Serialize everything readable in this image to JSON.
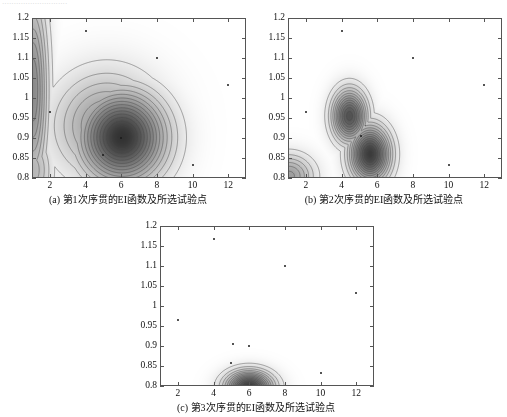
{
  "page": {
    "top_cut_text": "····························",
    "background": "#ffffff",
    "ink": "#1a1a1a"
  },
  "chart_data": [
    {
      "id": "panel-a",
      "type": "heatmap",
      "title": "",
      "caption": "(a) 第1次序贯的EI函数及所选试验点",
      "xlabel": "",
      "ylabel": "",
      "xlim": [
        1,
        13
      ],
      "ylim": [
        0.8,
        1.2
      ],
      "xticks": [
        2,
        4,
        6,
        8,
        10,
        12
      ],
      "yticks": [
        0.8,
        0.85,
        0.9,
        0.95,
        1,
        1.05,
        1.1,
        1.15,
        1.2
      ],
      "xtick_labels": [
        "2",
        "4",
        "6",
        "8",
        "10",
        "12"
      ],
      "ytick_labels": [
        "0.8",
        "0.85",
        "0.9",
        "0.95",
        "1",
        "1.05",
        "1.1",
        "1.15",
        "1.2"
      ],
      "grid": false,
      "legend": "none",
      "colormap": "grayscale-inverted",
      "peaks": [
        {
          "x": 6.05,
          "y": 0.902,
          "amp": 1.0,
          "sx": 1.55,
          "sy": 0.072,
          "rot": 0.25
        },
        {
          "x": 5.2,
          "y": 0.93,
          "amp": 0.44,
          "sx": 1.9,
          "sy": 0.085,
          "rot": 0.35
        },
        {
          "x": 1.05,
          "y": 1.02,
          "amp": 0.52,
          "sx": 0.55,
          "sy": 0.16,
          "rot": 0.0
        },
        {
          "x": 1.05,
          "y": 0.82,
          "amp": 0.3,
          "sx": 0.7,
          "sy": 0.06,
          "rot": 0.0
        }
      ],
      "points": [
        {
          "x": 4.0,
          "y": 1.167
        },
        {
          "x": 8.0,
          "y": 1.1
        },
        {
          "x": 12.0,
          "y": 1.032
        },
        {
          "x": 2.0,
          "y": 0.965
        },
        {
          "x": 5.0,
          "y": 0.857
        },
        {
          "x": 10.0,
          "y": 0.833
        },
        {
          "x": 6.0,
          "y": 0.9
        }
      ]
    },
    {
      "id": "panel-b",
      "type": "heatmap",
      "title": "",
      "caption": "(b) 第2次序贯的EI函数及所选试验点",
      "xlabel": "",
      "ylabel": "",
      "xlim": [
        1,
        13
      ],
      "ylim": [
        0.8,
        1.2
      ],
      "xticks": [
        2,
        4,
        6,
        8,
        10,
        12
      ],
      "yticks": [
        0.8,
        0.85,
        0.9,
        0.95,
        1,
        1.05,
        1.1,
        1.15,
        1.2
      ],
      "xtick_labels": [
        "2",
        "4",
        "6",
        "8",
        "10",
        "12"
      ],
      "ytick_labels": [
        "0.8",
        "0.85",
        "0.9",
        "0.95",
        "1",
        "1.05",
        "1.1",
        "1.15",
        "1.2"
      ],
      "grid": false,
      "legend": "none",
      "colormap": "grayscale-inverted",
      "peaks": [
        {
          "x": 4.45,
          "y": 0.955,
          "amp": 0.82,
          "sx": 0.62,
          "sy": 0.042,
          "rot": 0.0
        },
        {
          "x": 5.6,
          "y": 0.86,
          "amp": 0.95,
          "sx": 0.72,
          "sy": 0.045,
          "rot": -0.2
        },
        {
          "x": 4.9,
          "y": 0.905,
          "amp": 0.3,
          "sx": 0.55,
          "sy": 0.035,
          "rot": 0.0
        },
        {
          "x": 1.05,
          "y": 0.805,
          "amp": 0.42,
          "sx": 0.9,
          "sy": 0.035,
          "rot": 0.0
        }
      ],
      "points": [
        {
          "x": 4.0,
          "y": 1.167
        },
        {
          "x": 8.0,
          "y": 1.1
        },
        {
          "x": 12.0,
          "y": 1.032
        },
        {
          "x": 2.0,
          "y": 0.965
        },
        {
          "x": 5.1,
          "y": 0.905
        },
        {
          "x": 10.0,
          "y": 0.833
        }
      ]
    },
    {
      "id": "panel-c",
      "type": "heatmap",
      "title": "",
      "caption": "(c) 第3次序贯的EI函数及所选试验点",
      "xlabel": "",
      "ylabel": "",
      "xlim": [
        1,
        13
      ],
      "ylim": [
        0.8,
        1.2
      ],
      "xticks": [
        2,
        4,
        6,
        8,
        10,
        12
      ],
      "yticks": [
        0.8,
        0.85,
        0.9,
        0.95,
        1,
        1.05,
        1.1,
        1.15,
        1.2
      ],
      "xtick_labels": [
        "2",
        "4",
        "6",
        "8",
        "10",
        "12"
      ],
      "ytick_labels": [
        "0.8",
        "0.85",
        "0.9",
        "0.95",
        "1",
        "1.05",
        "1.1",
        "1.15",
        "1.2"
      ],
      "grid": false,
      "legend": "none",
      "colormap": "grayscale-inverted",
      "peaks": [
        {
          "x": 6.0,
          "y": 0.797,
          "amp": 0.95,
          "sx": 0.85,
          "sy": 0.026,
          "rot": 0.0
        }
      ],
      "points": [
        {
          "x": 4.0,
          "y": 1.167
        },
        {
          "x": 8.0,
          "y": 1.1
        },
        {
          "x": 12.0,
          "y": 1.032
        },
        {
          "x": 2.0,
          "y": 0.965
        },
        {
          "x": 5.1,
          "y": 0.905
        },
        {
          "x": 6.0,
          "y": 0.9
        },
        {
          "x": 5.0,
          "y": 0.857
        },
        {
          "x": 10.0,
          "y": 0.833
        }
      ]
    }
  ]
}
